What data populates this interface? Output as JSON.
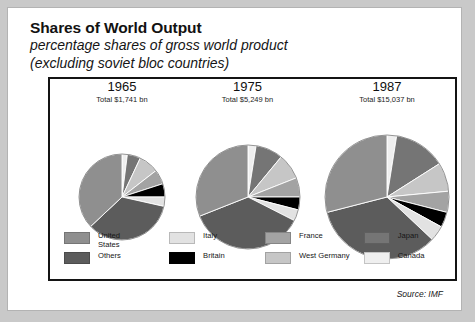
{
  "title": {
    "main": "Shares of World Output",
    "sub_line1": "percentage shares of gross world product",
    "sub_line2": "(excluding soviet bloc countries)"
  },
  "source": "Source: IMF",
  "legend": {
    "entries": [
      {
        "label": "United\nStates",
        "color": "#8f8f8f",
        "key": "united-states"
      },
      {
        "label": "Italy",
        "color": "#e2e2e2",
        "key": "italy"
      },
      {
        "label": "France",
        "color": "#a3a3a3",
        "key": "france"
      },
      {
        "label": "Japan",
        "color": "#757575",
        "key": "japan"
      },
      {
        "label": "Others",
        "color": "#5c5c5c",
        "key": "others"
      },
      {
        "label": "Britain",
        "color": "#000000",
        "key": "britain"
      },
      {
        "label": "West Germany",
        "color": "#c6c6c6",
        "key": "west-germany"
      },
      {
        "label": "Canada",
        "color": "#efefef",
        "key": "canada"
      }
    ]
  },
  "chart_data": {
    "type": "pie",
    "title": "Shares of World Output",
    "subtitle": "percentage shares of gross world product (excluding soviet bloc countries)",
    "source": "Source: IMF",
    "legend_position": "bottom",
    "categories": [
      "United States",
      "Japan",
      "West Germany",
      "France",
      "Britain",
      "Italy",
      "Others",
      "Canada"
    ],
    "colors": [
      "#8f8f8f",
      "#757575",
      "#c6c6c6",
      "#a3a3a3",
      "#000000",
      "#e2e2e2",
      "#5c5c5c",
      "#efefef"
    ],
    "panels": [
      {
        "year": "1965",
        "total_label": "Total $1,741 bn",
        "total_value": 1741,
        "total_units": "US$ bn",
        "radius_px": 43,
        "values": [
          37.0,
          5.0,
          7.5,
          5.5,
          5.0,
          3.5,
          34.5,
          2.0
        ]
      },
      {
        "year": "1975",
        "total_label": "Total $5,249 bn",
        "total_value": 5249,
        "total_units": "US$ bn",
        "radius_px": 52,
        "values": [
          31.0,
          8.5,
          8.0,
          6.0,
          4.0,
          3.5,
          36.5,
          2.5
        ]
      },
      {
        "year": "1987",
        "total_label": "Total $15,037 bn",
        "total_value": 15037,
        "total_units": "US$ bn",
        "radius_px": 62,
        "values": [
          29.0,
          13.5,
          7.5,
          5.5,
          4.0,
          4.0,
          34.0,
          2.5
        ]
      }
    ]
  }
}
